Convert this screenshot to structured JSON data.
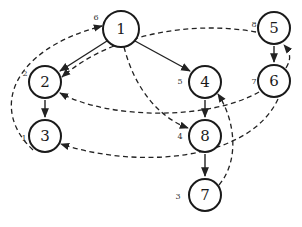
{
  "diagram": {
    "type": "directed-graph",
    "nodes": [
      {
        "id": "1",
        "label": "1",
        "order": "",
        "x": 121,
        "y": 29
      },
      {
        "id": "2",
        "label": "2",
        "order": "2",
        "x": 45,
        "y": 82
      },
      {
        "id": "3",
        "label": "3",
        "order": "1",
        "x": 45,
        "y": 136
      },
      {
        "id": "4",
        "label": "4",
        "order": "5",
        "x": 205,
        "y": 82
      },
      {
        "id": "5",
        "label": "5",
        "order": "8",
        "x": 274,
        "y": 28
      },
      {
        "id": "6",
        "label": "6",
        "order": "7",
        "x": 274,
        "y": 81
      },
      {
        "id": "7",
        "label": "7",
        "order": "3",
        "x": 205,
        "y": 195
      },
      {
        "id": "8",
        "label": "8",
        "order": "4",
        "x": 205,
        "y": 136
      }
    ],
    "node1_order": "6",
    "solid_edges": [
      {
        "from": "1",
        "to": "2"
      },
      {
        "from": "1",
        "to": "4"
      },
      {
        "from": "2",
        "to": "3"
      },
      {
        "from": "4",
        "to": "8"
      },
      {
        "from": "8",
        "to": "7"
      },
      {
        "from": "5",
        "to": "6"
      }
    ],
    "dashed_edges": [
      {
        "from": "3",
        "to": "1"
      },
      {
        "from": "5",
        "to": "2"
      },
      {
        "from": "6",
        "to": "2"
      },
      {
        "from": "1",
        "to": "8"
      },
      {
        "from": "6",
        "to": "5"
      },
      {
        "from": "7",
        "to": "4"
      },
      {
        "from": "6",
        "to": "3"
      }
    ],
    "colors": {
      "stroke": "#1a1a1a",
      "background": "#ffffff"
    }
  }
}
